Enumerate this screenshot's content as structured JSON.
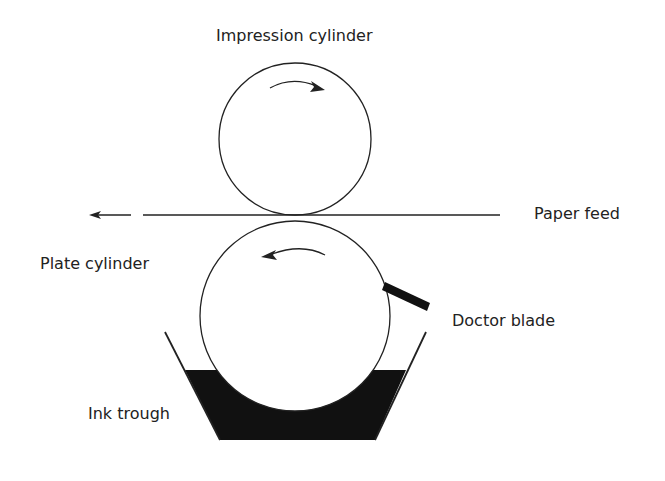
{
  "labels": {
    "impression_cylinder": "Impression cylinder",
    "plate_cylinder": "Plate cylinder",
    "paper_feed": "Paper feed",
    "doctor_blade": "Doctor blade",
    "ink_trough": "Ink trough"
  },
  "colors": {
    "line": "#222222",
    "ink": "#111111",
    "background": "#ffffff"
  }
}
